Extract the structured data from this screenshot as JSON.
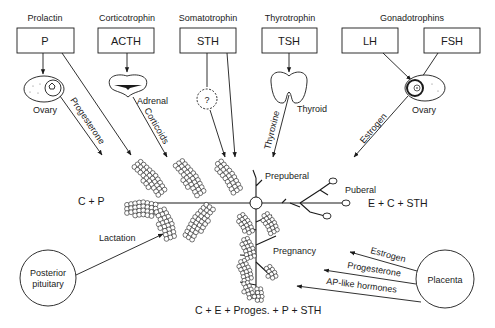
{
  "hormones": [
    {
      "name": "Prolactin",
      "abbr": "P"
    },
    {
      "name": "Corticotrophin",
      "abbr": "ACTH"
    },
    {
      "name": "Somatotrophin",
      "abbr": "STH"
    },
    {
      "name": "Thyrotrophin",
      "abbr": "TSH"
    },
    {
      "name": "Gonadotrophins",
      "abbr_lh": "LH",
      "abbr_fsh": "FSH"
    }
  ],
  "organs": {
    "ovary_left": "Ovary",
    "adrenal": "Adrenal",
    "unknown": "?",
    "thyroid": "Thyroid",
    "ovary_right": "Ovary",
    "posterior_pituitary_line1": "Posterior",
    "posterior_pituitary_line2": "pituitary",
    "placenta": "Placenta"
  },
  "arrows": {
    "progesterone": "Progesterone",
    "corticoids": "Corticoids",
    "thyroxine": "Thyroxine",
    "estrogen_top": "Estrogen",
    "lactation": "Lactation",
    "estrogen_placenta": "Estrogen",
    "progesterone_placenta": "Progesterone",
    "ap_like": "AP-like hormones"
  },
  "stages": {
    "prepuberal": "Prepuberal",
    "puberal": "Puberal",
    "pregnancy": "Pregnancy"
  },
  "formulas": {
    "lactation": "C + P",
    "puberal": "E + C + STH",
    "pregnancy": "C + E + Proges. + P + STH"
  }
}
